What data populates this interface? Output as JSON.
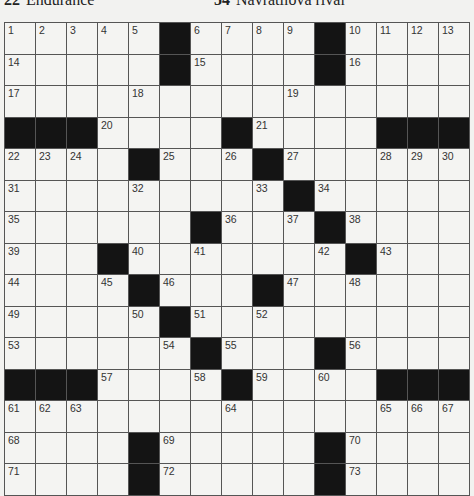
{
  "clue_strip": [
    {
      "number": "22",
      "text": "Endurance"
    },
    {
      "number": "54",
      "text": "Navratilova rival"
    }
  ],
  "grid": {
    "rows": 15,
    "cols": 15,
    "layout": [
      "1,2,3,4,5,#,6,7,8,9,#,10,11,12,13",
      "14,.,.,.,.,#,15,.,.,.,#,16,.,.,.",
      "17,.,.,.,18,.,.,.,.,19,.,.,.,.,.",
      "#,#,#,20,.,.,.,#,21,.,.,.,#,#,#",
      "22,23,24,.,#,25,.,26,#,27,.,.,28,29,30",
      "31,.,.,.,32,.,.,.,33,#,34,.,.,.,.",
      "35,.,.,.,.,.,#,36,.,37,#,38,.,.,.",
      "39,.,.,#,40,.,41,.,.,.,42,#,43,.,.",
      "44,.,.,45,#,46,.,.,#,47,.,48,.,.,.",
      "49,.,.,.,50,#,51,.,52,.,.,.,.,.,.",
      "53,.,.,.,.,54,#,55,.,.,#,56,.,.,.",
      "#,#,#,57,.,.,58,#,59,.,60,.,#,#,#",
      "61,62,63,.,.,.,.,64,.,.,.,.,65,66,67",
      "68,.,.,.,#,69,.,.,.,.,#,70,.,.,.",
      "71,.,.,.,#,72,.,.,.,.,#,73,.,.,."
    ]
  },
  "colors": {
    "block": "#141414",
    "cell": "#f4f4f2",
    "line": "#555555"
  }
}
